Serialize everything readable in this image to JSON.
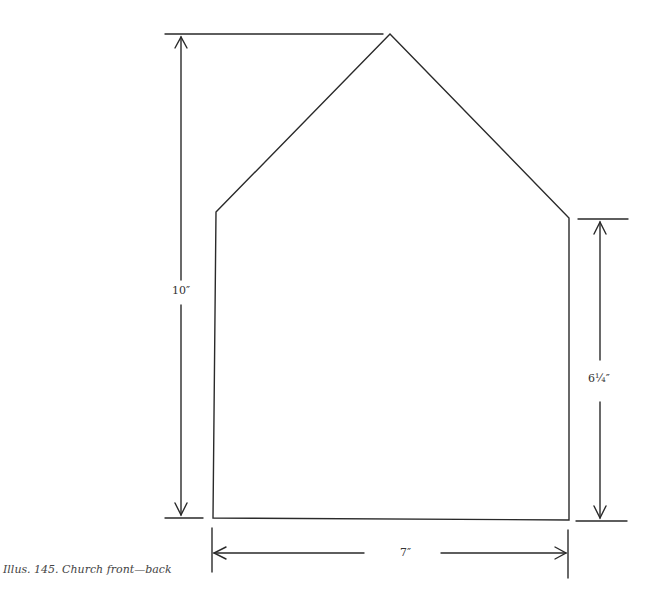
{
  "figure": {
    "caption": "Illus. 145. Church front—back",
    "shape": "church-front-back-pattern",
    "dimensions": {
      "total_height": "10″",
      "wall_height": "6¼″",
      "width": "7″"
    }
  },
  "colors": {
    "line": "#2a2a2a",
    "background": "#ffffff"
  }
}
